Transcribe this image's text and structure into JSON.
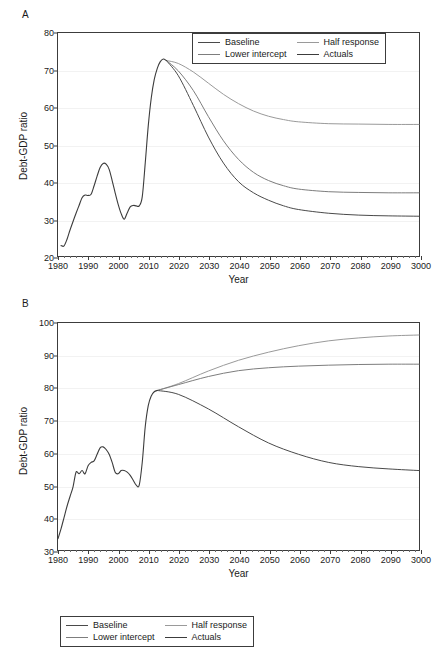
{
  "figure": {
    "panel_a_letter": "A",
    "panel_b_letter": "B",
    "caption": ""
  },
  "colors": {
    "baseline": "#4a4a4a",
    "half_response": "#9a9a9a",
    "lower_intercept": "#7d7d7d",
    "actuals": "#3c3c3c",
    "axis": "#3c3c3c",
    "grid": "#f2f2f2"
  },
  "legend": {
    "baseline": "Baseline",
    "half_response": "Half response",
    "lower_intercept": "Lower intercept",
    "actuals": "Actuals"
  },
  "axis_titles": {
    "x": "Year",
    "y": "Debt-GDP ratio"
  },
  "chart_data": [
    {
      "type": "line",
      "panel": "A",
      "title": "",
      "xlabel": "Year",
      "ylabel": "Debt-GDP ratio",
      "xlim": [
        1980,
        2100
      ],
      "ylim": [
        20,
        80
      ],
      "xticks": [
        1980,
        1990,
        2000,
        2010,
        2020,
        2030,
        2040,
        2050,
        2060,
        2070,
        2080,
        2090,
        2100
      ],
      "xticklabels": [
        "1980",
        "1990",
        "2000",
        "2010",
        "2020",
        "2030",
        "2040",
        "2050",
        "2060",
        "2070",
        "2080",
        "2090",
        "3000"
      ],
      "yticks": [
        20,
        30,
        40,
        50,
        60,
        70,
        80
      ],
      "grid": true,
      "legend_position": "top-right",
      "series": [
        {
          "name": "Actuals",
          "x": [
            1981,
            1982,
            1983,
            1984,
            1985,
            1986,
            1987,
            1988,
            1989,
            1990,
            1991,
            1992,
            1993,
            1994,
            1995,
            1996,
            1997,
            1998,
            1999,
            2000,
            2001,
            2002,
            2003,
            2004,
            2005,
            2006,
            2007,
            2008,
            2009,
            2010,
            2011,
            2012,
            2013,
            2014,
            2015,
            2016
          ],
          "values": [
            22.8,
            22.7,
            24.5,
            27.0,
            29.3,
            31.5,
            33.6,
            35.7,
            36.4,
            36.3,
            36.6,
            38.9,
            41.5,
            43.8,
            44.9,
            44.7,
            43.3,
            40.3,
            37.0,
            33.9,
            31.4,
            29.9,
            31.6,
            33.2,
            33.6,
            33.5,
            33.5,
            35.9,
            45.0,
            55.0,
            62.5,
            67.5,
            70.5,
            72.3,
            73.0,
            72.6
          ]
        },
        {
          "name": "Baseline",
          "x": [
            2016,
            2020,
            2025,
            2030,
            2035,
            2040,
            2045,
            2050,
            2055,
            2060,
            2070,
            2080,
            2090,
            2100
          ],
          "values": [
            72.6,
            68.5,
            60.5,
            52.0,
            45.0,
            40.0,
            37.0,
            35.0,
            33.5,
            32.5,
            31.5,
            31.0,
            30.8,
            30.7
          ]
        },
        {
          "name": "Lower intercept",
          "x": [
            2016,
            2020,
            2025,
            2030,
            2035,
            2040,
            2045,
            2050,
            2055,
            2060,
            2070,
            2080,
            2090,
            2100
          ],
          "values": [
            72.6,
            69.8,
            64.5,
            57.5,
            51.0,
            46.0,
            42.5,
            40.3,
            38.9,
            38.0,
            37.3,
            37.1,
            37.0,
            37.0
          ]
        },
        {
          "name": "Half response",
          "x": [
            2016,
            2020,
            2025,
            2030,
            2035,
            2040,
            2045,
            2050,
            2055,
            2060,
            2070,
            2080,
            2090,
            2100
          ],
          "values": [
            72.6,
            71.8,
            69.5,
            66.5,
            63.5,
            61.0,
            59.0,
            57.6,
            56.7,
            56.1,
            55.6,
            55.5,
            55.4,
            55.4
          ]
        }
      ]
    },
    {
      "type": "line",
      "panel": "B",
      "title": "",
      "xlabel": "Year",
      "ylabel": "Debt-GDP ratio",
      "xlim": [
        1980,
        2100
      ],
      "ylim": [
        30,
        100
      ],
      "xticks": [
        1980,
        1990,
        2000,
        2010,
        2020,
        2030,
        2040,
        2050,
        2060,
        2070,
        2080,
        2090,
        2100
      ],
      "xticklabels": [
        "1980",
        "1990",
        "2000",
        "2010",
        "2020",
        "2030",
        "2040",
        "2050",
        "2060",
        "2070",
        "2080",
        "2090",
        "3000"
      ],
      "yticks": [
        30,
        40,
        50,
        60,
        70,
        80,
        90,
        100
      ],
      "grid": true,
      "legend_position": "top-left",
      "series": [
        {
          "name": "Actuals",
          "x": [
            1980,
            1981,
            1982,
            1983,
            1984,
            1985,
            1986,
            1987,
            1988,
            1989,
            1990,
            1991,
            1992,
            1993,
            1994,
            1995,
            1996,
            1997,
            1998,
            1999,
            2000,
            2001,
            2002,
            2003,
            2004,
            2005,
            2006,
            2007,
            2008,
            2009,
            2010,
            2011,
            2012,
            2013
          ],
          "values": [
            33.5,
            36.5,
            40.0,
            43.5,
            46.5,
            49.5,
            54.0,
            53.5,
            54.5,
            53.5,
            56.0,
            57.0,
            57.5,
            59.5,
            61.5,
            61.8,
            61.0,
            59.5,
            57.0,
            54.0,
            53.5,
            54.5,
            54.5,
            54.0,
            53.0,
            51.5,
            50.0,
            50.0,
            57.0,
            68.0,
            74.5,
            77.5,
            78.8,
            79.2
          ]
        },
        {
          "name": "Baseline",
          "x": [
            2013,
            2020,
            2030,
            2040,
            2050,
            2060,
            2070,
            2080,
            2090,
            2100
          ],
          "values": [
            79.2,
            78.0,
            73.5,
            68.0,
            63.0,
            59.5,
            57.0,
            55.7,
            55.0,
            54.5
          ]
        },
        {
          "name": "Lower intercept",
          "x": [
            2013,
            2020,
            2030,
            2040,
            2050,
            2060,
            2070,
            2080,
            2090,
            2100
          ],
          "values": [
            79.2,
            81.0,
            83.5,
            85.3,
            86.2,
            86.7,
            87.0,
            87.2,
            87.3,
            87.3
          ]
        },
        {
          "name": "Half response",
          "x": [
            2013,
            2020,
            2030,
            2040,
            2050,
            2060,
            2070,
            2080,
            2090,
            2100
          ],
          "values": [
            79.2,
            81.3,
            85.2,
            88.5,
            91.0,
            93.0,
            94.5,
            95.4,
            96.0,
            96.3
          ]
        }
      ]
    }
  ]
}
